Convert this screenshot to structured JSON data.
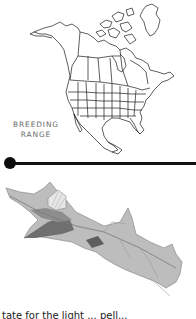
{
  "map": {
    "label_line1": "BREEDING",
    "label_line2": "RANGE",
    "region": "North America"
  },
  "divider": {
    "dot_color": "#0d0d0d",
    "line_color": "#111111"
  },
  "illustration": {
    "subject": "leaf-like insect / dried leaf drawing"
  },
  "caption": {
    "text": "tate for the light ... pell..."
  }
}
